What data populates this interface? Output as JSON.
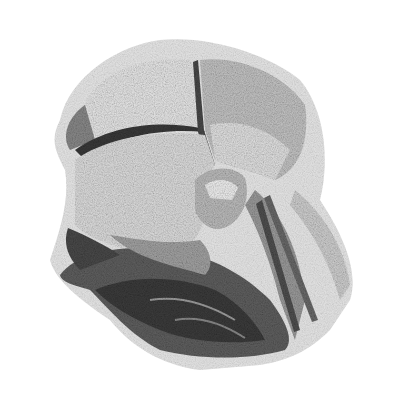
{
  "image": {
    "description": "Stippled grayscale anatomical-style illustration of organ-like forms on white background",
    "background": "#ffffff",
    "palette": {
      "light": "#e4e4e4",
      "mid": "#a8a8a8",
      "dark": "#5a5a5a",
      "darkest": "#2e2e2e"
    }
  }
}
